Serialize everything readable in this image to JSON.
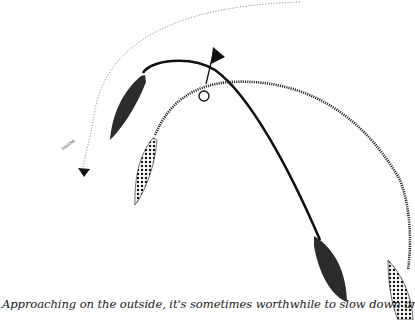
{
  "figure": {
    "caption": "Approaching on the outside, it's sometimes worthwhile to slow down and swing wide, hoping",
    "course_label": "course",
    "elements": [
      {
        "name": "windward-mark",
        "icon": "circle-buoy",
        "x": 204,
        "y": 96
      },
      {
        "name": "flag",
        "icon": "triangle-flag",
        "x": 213,
        "y": 50
      },
      {
        "name": "boat-solid-lead",
        "fill": "solid",
        "color": "#333333"
      },
      {
        "name": "boat-dotted-lead",
        "fill": "dotted",
        "color": "#222222"
      },
      {
        "name": "boat-solid-trail",
        "fill": "solid",
        "color": "#333333"
      },
      {
        "name": "boat-dotted-trail",
        "fill": "dotted",
        "color": "#222222"
      },
      {
        "name": "course-arrow",
        "icon": "arrowhead"
      }
    ],
    "colors": {
      "ink": "#1a1a1a",
      "faint": "#9a9a9a",
      "background": "#ffffff"
    }
  }
}
